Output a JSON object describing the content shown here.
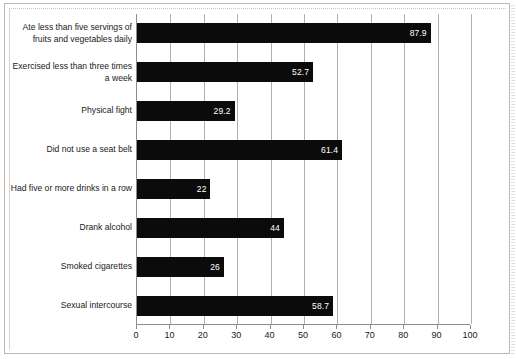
{
  "chart_data": {
    "type": "bar",
    "orientation": "horizontal",
    "title": "",
    "subtitle": "",
    "xlabel": "",
    "ylabel": "",
    "xlim": [
      0,
      100
    ],
    "xticks": [
      0,
      10,
      20,
      30,
      40,
      50,
      60,
      70,
      80,
      90,
      100
    ],
    "xtick_labels": [
      "0",
      "10",
      "20",
      "30",
      "40",
      "50",
      "60",
      "70",
      "80",
      "90",
      "100"
    ],
    "grid": "vertical",
    "legend": "none",
    "bar_color": "#0b0b0b",
    "value_label_color": "#ffffff",
    "categories": [
      "Ate less than five servings of fruits and vegetables daily",
      "Exercised less than three times a week",
      "Physical fight",
      "Did not use a seat belt",
      "Had five or more drinks in a row",
      "Drank alcohol",
      "Smoked cigarettes",
      "Sexual intercourse"
    ],
    "values": [
      87.9,
      52.7,
      29.2,
      61.4,
      22,
      44,
      26,
      58.7
    ],
    "value_labels": [
      "87.9",
      "52.7",
      "29.2",
      "61.4",
      "22",
      "44",
      "26",
      "58.7"
    ]
  }
}
